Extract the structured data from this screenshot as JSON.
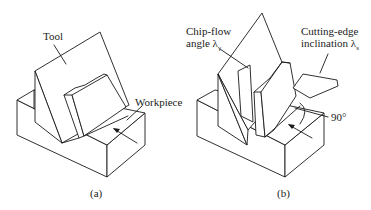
{
  "figure": {
    "panel_a": {
      "caption": "(a)",
      "labels": {
        "tool": "Tool",
        "workpiece": "Workpiece"
      }
    },
    "panel_b": {
      "caption": "(b)",
      "labels": {
        "chip_flow_line1": "Chip-flow",
        "chip_flow_line2": "angle λ",
        "chip_flow_sub": "γ",
        "cutting_edge_line1": "Cutting-edge",
        "cutting_edge_line2": "inclination λ",
        "cutting_edge_sub": "s",
        "angle": "90°"
      }
    },
    "colors": {
      "line": "#1a1a1a",
      "background": "#ffffff"
    }
  }
}
